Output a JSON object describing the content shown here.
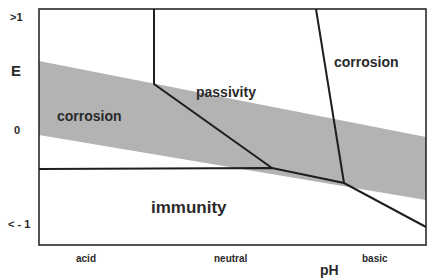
{
  "diagram": {
    "y_axis": {
      "label": "E",
      "ticks": [
        ">1",
        "0",
        "< - 1"
      ]
    },
    "x_axis": {
      "label": "pH",
      "categories": [
        "acid",
        "neutral",
        "basic"
      ]
    },
    "regions": {
      "corrosion_left": "corrosion",
      "passivity": "passivity",
      "corrosion_right": "corrosion",
      "immunity": "immunity"
    },
    "colors": {
      "water_stability_band": "#b3b3b3",
      "lines": "#1e1e1e",
      "background": "#ffffff"
    }
  }
}
